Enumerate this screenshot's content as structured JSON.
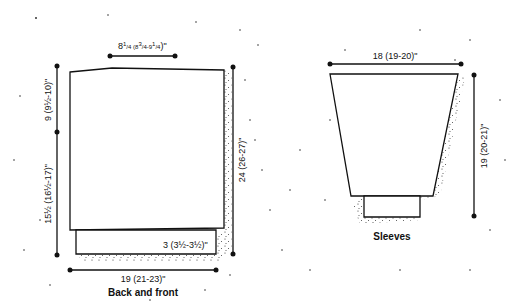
{
  "back_and_front": {
    "caption": "Back and front",
    "top_width": {
      "main": "8",
      "frac": "1/4",
      "rest_open": " (8",
      "rest_frac1": "3/4",
      "rest_mid": "-9",
      "rest_frac2": "1/4",
      "rest_close": ")\""
    },
    "armhole_depth": "9 (9½-10)\"",
    "side_length": "15½ (16½-17)\"",
    "total_length": "24 (26-27)\"",
    "ribbing_height": "3 (3½-3½)\"",
    "bottom_width": "19 (21-23)\""
  },
  "sleeves": {
    "caption": "Sleeves",
    "top_width": "18 (19-20)\"",
    "length": "19 (20-21)\""
  },
  "colors": {
    "line": "#111111",
    "dot": "#222222",
    "background": "#ffffff"
  }
}
